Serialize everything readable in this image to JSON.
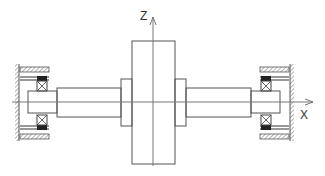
{
  "diagram": {
    "axes": {
      "x_label": "X",
      "z_label": "Z"
    },
    "colors": {
      "line": "#555555",
      "axis": "#777777",
      "dark": "#222222",
      "background": "#ffffff"
    },
    "components": [
      "left-wall-support",
      "left-bearing-housing",
      "left-bearing",
      "left-shaft-journal",
      "left-shaft-segment",
      "left-hub",
      "disk",
      "right-hub",
      "right-shaft-segment",
      "right-shaft-journal",
      "right-bearing",
      "right-bearing-housing",
      "right-wall-support"
    ]
  }
}
